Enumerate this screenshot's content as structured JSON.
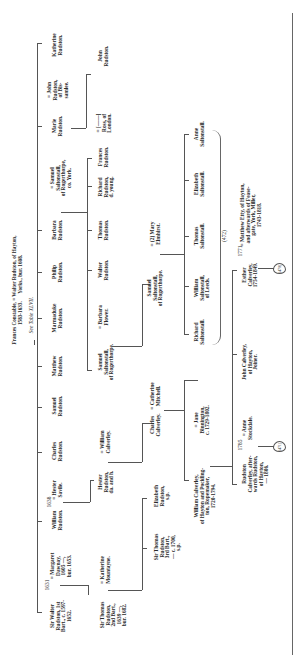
{
  "diagram": {
    "type": "genealogical-table",
    "orientation": "rotated-90-ccw",
    "root": {
      "text": "Frances Constable, = Walter Rudston, of Hayton,\n1583-1633.      Yorks., bur. 1608.",
      "note": "See Table XLVII."
    },
    "gen1": [
      {
        "id": "walter",
        "text": "Sir Walter\nRudston, 1st\nBart., c. 1597-\n1652.",
        "marriage_year": "1631",
        "spouse": "= Margaret\nDawnay,\n1605 —,\nbur. 1653."
      },
      {
        "id": "william",
        "text": "William\nRudston.",
        "marriage_year": "1638",
        "spouse": "= Hester\nSavile."
      },
      {
        "id": "charles",
        "text": "Charles\nRudston."
      },
      {
        "id": "samuel",
        "text": "Samuel\nRudston."
      },
      {
        "id": "matthew",
        "text": "Matthew\nRudston."
      },
      {
        "id": "marmaduke",
        "text": "Marmaduke\nRudston."
      },
      {
        "id": "philip",
        "text": "Philip\nRudston."
      },
      {
        "id": "barbara",
        "text": "Barbara\nRudston.",
        "spouse": "= Samuel\nSaltonstall,\nof Rogerthorpe,\nco. York."
      },
      {
        "id": "marie",
        "text": "Marie\nRudston.",
        "spouse": "= John\nRudston,\nof Bis-\nsamlee."
      },
      {
        "id": "katherine",
        "text": "Katherine\nRudston."
      }
    ],
    "gen2": [
      {
        "id": "thomas2",
        "text": "Sir Thomas\nRudston,\n2nd Bart.,\n1639 —,\nbur. 1682.",
        "spouse": "= Katherine\nMountayne."
      },
      {
        "id": "hester",
        "text": "Hester\nRudston,\nda. and h.",
        "spouse": "= William\nCalverley."
      },
      {
        "id": "samuel_s",
        "text": "Samuel\nSaltonstall,\nof Rogerthorpe.",
        "spouse": "= Barbara\nFlower."
      },
      {
        "id": "walter_r",
        "text": "Walter\nRudston."
      },
      {
        "id": "thomas_r",
        "text": "Thomas\nRudston."
      },
      {
        "id": "richard_r",
        "text": "Richard\nRudston,\nd. young."
      },
      {
        "id": "frances_r",
        "text": "Frances\nRudston.",
        "spouse": "= [——]\nRoss, of\nLondon."
      },
      {
        "id": "john_r",
        "text": "John\nRudston."
      }
    ],
    "gen3": [
      {
        "id": "thomas3",
        "text": "Sir Thomas\nRudston,\n3rd Bart.,\n— c. 1700,\ns.p."
      },
      {
        "id": "elizabeth_r",
        "text": "Elizabeth\nRudston,\ns.p."
      },
      {
        "id": "charles_c",
        "text": "Charles\nCalverley.",
        "spouse": "= Catherine\nMitchell."
      },
      {
        "id": "samuel_s2",
        "text": "Samuel\nSaltonstall,\nof Rogerthorpe.",
        "spouse": "= (2) Mary\nElmhirst."
      }
    ],
    "gen4": [
      {
        "id": "william_c",
        "text": "William Calverley,\nof Hayton and Pockling-\nton, Ropemaker,\n1720-1794.",
        "spouse": "= Jane\nBinnington,\nc. 1729-1802."
      },
      {
        "id": "richard_s",
        "text": "Richard\nSaltonstall."
      },
      {
        "id": "william_s",
        "text": "William\nSaltonstall,\nof Leeds."
      },
      {
        "id": "thomas_s",
        "text": "Thomas\nSaltonstall."
      },
      {
        "id": "elizabeth_s",
        "text": "Elizabeth\nSaltonstall."
      },
      {
        "id": "anne_s",
        "text": "Anne\nSaltonstall."
      }
    ],
    "gen5": [
      {
        "id": "rudston_c",
        "text": "Rudston\nCalverley, after-\nwards Rudston,\nof Hayton,\n— 1806.",
        "marriage_year": "1785",
        "spouse": "= Anne\nStockdale."
      },
      {
        "id": "john_c",
        "text": "John Calverley,\nof Hayton,\nJoiner."
      },
      {
        "id": "esther_c",
        "text": "Esther\nCalverley,\n1754-1849.",
        "marriage_year": "1771",
        "spouse": "= Matthew Etty, of Hayton,\nand afterwards of Fease-\ngate, York, Miller,\n1743-1818."
      }
    ],
    "references": {
      "saltonstall_ref": "(472)",
      "rudston_ref": "(471)",
      "etty_ref": "(470)"
    }
  }
}
